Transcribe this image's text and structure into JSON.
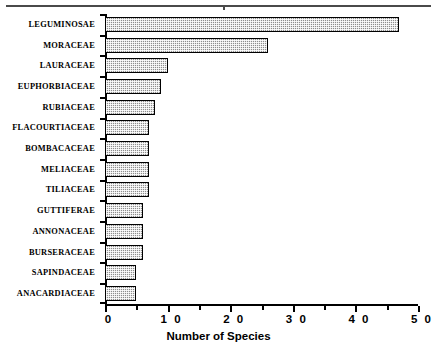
{
  "chart_data": {
    "type": "bar",
    "orientation": "horizontal",
    "title": "",
    "xlabel": "Number of Species",
    "ylabel": "",
    "xlim": [
      0,
      50
    ],
    "ylim": null,
    "grid": false,
    "legend": null,
    "xticks": [
      0,
      10,
      20,
      30,
      40,
      50
    ],
    "xticklabels": [
      "0",
      "1 0",
      "2 0",
      "3 0",
      "4 0",
      "5 0"
    ],
    "xminorticks": [
      5,
      15,
      25,
      35,
      45
    ],
    "categories": [
      "LEGUMINOSAE",
      "MORACEAE",
      "LAURACEAE",
      "EUPHORBIACEAE",
      "RUBIACEAE",
      "FLACOURTIACEAE",
      "BOMBACACEAE",
      "MELIACEAE",
      "TILIACEAE",
      "GUTTIFERAE",
      "ANNONACEAE",
      "BURSERACEAE",
      "SAPINDACEAE",
      "ANACARDIACEAE"
    ],
    "values": [
      47,
      26,
      10,
      9,
      8,
      7,
      7,
      7,
      7,
      6,
      6,
      6,
      5,
      5
    ],
    "bar_fill_color": "#8e8e8e",
    "bar_edge_color": "#000000",
    "axis_color": "#000000",
    "top_rule_color": "#4a4a4a"
  }
}
